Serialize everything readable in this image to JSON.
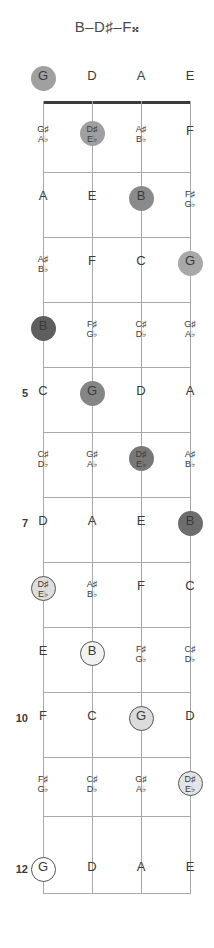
{
  "title": "B–D♯–F𝄪",
  "diagram": {
    "type": "guitar-fretboard",
    "orientation": "vertical",
    "instrument_strings": [
      "G",
      "D",
      "A",
      "E"
    ],
    "string_x": [
      43,
      92,
      141,
      190
    ],
    "nut_y": 101,
    "fret_spacing": 64.8,
    "fret_count": 12,
    "shown_fret_numbers": [
      "5",
      "7",
      "10",
      "12"
    ],
    "chord_tones": [
      "B",
      "D♯",
      "F𝄪"
    ],
    "colors": {
      "line": "#a8a8a8",
      "nut": "#3b3b3b",
      "text": "#3a3a3a",
      "marker_darkest": "#606060",
      "marker_dark": "#767676",
      "marker_mid": "#9a9a9a",
      "marker_light": "#c9c9c9",
      "marker_lighter": "#e0e0e0",
      "marker_open": "#ffffff"
    }
  },
  "open_strings": [
    {
      "label": "G",
      "x": 43,
      "marked": true,
      "fill": "#a0a0a0",
      "ring": false
    },
    {
      "label": "D",
      "x": 92,
      "marked": false
    },
    {
      "label": "A",
      "x": 141,
      "marked": false
    },
    {
      "label": "E",
      "x": 190,
      "marked": false
    }
  ],
  "frets": [
    {
      "number": 1,
      "label": "",
      "y": 133,
      "notes": [
        {
          "x": 43,
          "line1": "G♯",
          "line2": "A♭",
          "accidental": true,
          "marked": false
        },
        {
          "x": 92,
          "line1": "D♯",
          "line2": "E♭",
          "accidental": true,
          "marked": true,
          "fill": "#a0a0a0",
          "ring": false
        },
        {
          "x": 141,
          "line1": "A♯",
          "line2": "B♭",
          "accidental": true,
          "marked": false
        },
        {
          "x": 190,
          "line1": "F",
          "line2": "",
          "accidental": false,
          "marked": false
        }
      ]
    },
    {
      "number": 2,
      "label": "",
      "y": 198,
      "notes": [
        {
          "x": 43,
          "line1": "A",
          "line2": "",
          "accidental": false,
          "marked": false
        },
        {
          "x": 92,
          "line1": "E",
          "line2": "",
          "accidental": false,
          "marked": false
        },
        {
          "x": 141,
          "line1": "B",
          "line2": "",
          "accidental": false,
          "marked": true,
          "fill": "#8a8a8a",
          "ring": false
        },
        {
          "x": 190,
          "line1": "F♯",
          "line2": "G♭",
          "accidental": true,
          "marked": false
        }
      ]
    },
    {
      "number": 3,
      "label": "",
      "y": 263,
      "notes": [
        {
          "x": 43,
          "line1": "A♯",
          "line2": "B♭",
          "accidental": true,
          "marked": false
        },
        {
          "x": 92,
          "line1": "F",
          "line2": "",
          "accidental": false,
          "marked": false
        },
        {
          "x": 141,
          "line1": "C",
          "line2": "",
          "accidental": false,
          "marked": false
        },
        {
          "x": 190,
          "line1": "G",
          "line2": "",
          "accidental": false,
          "marked": true,
          "fill": "#a8a8a8",
          "ring": false
        }
      ]
    },
    {
      "number": 4,
      "label": "",
      "y": 328,
      "notes": [
        {
          "x": 43,
          "line1": "B",
          "line2": "",
          "accidental": false,
          "marked": true,
          "fill": "#5e5e5e",
          "ring": false
        },
        {
          "x": 92,
          "line1": "F♯",
          "line2": "G♭",
          "accidental": true,
          "marked": false
        },
        {
          "x": 141,
          "line1": "C♯",
          "line2": "D♭",
          "accidental": true,
          "marked": false
        },
        {
          "x": 190,
          "line1": "G♯",
          "line2": "A♭",
          "accidental": true,
          "marked": false
        }
      ]
    },
    {
      "number": 5,
      "label": "5",
      "y": 393,
      "notes": [
        {
          "x": 43,
          "line1": "C",
          "line2": "",
          "accidental": false,
          "marked": false
        },
        {
          "x": 92,
          "line1": "G",
          "line2": "",
          "accidental": false,
          "marked": true,
          "fill": "#858585",
          "ring": false
        },
        {
          "x": 141,
          "line1": "D",
          "line2": "",
          "accidental": false,
          "marked": false
        },
        {
          "x": 190,
          "line1": "A",
          "line2": "",
          "accidental": false,
          "marked": false
        }
      ]
    },
    {
      "number": 6,
      "label": "",
      "y": 458,
      "notes": [
        {
          "x": 43,
          "line1": "C♯",
          "line2": "D♭",
          "accidental": true,
          "marked": false
        },
        {
          "x": 92,
          "line1": "G♯",
          "line2": "A♭",
          "accidental": true,
          "marked": false
        },
        {
          "x": 141,
          "line1": "D♯",
          "line2": "E♭",
          "accidental": true,
          "marked": true,
          "fill": "#787878",
          "ring": false
        },
        {
          "x": 190,
          "line1": "A♯",
          "line2": "B♭",
          "accidental": true,
          "marked": false
        }
      ]
    },
    {
      "number": 7,
      "label": "7",
      "y": 523,
      "notes": [
        {
          "x": 43,
          "line1": "D",
          "line2": "",
          "accidental": false,
          "marked": false
        },
        {
          "x": 92,
          "line1": "A",
          "line2": "",
          "accidental": false,
          "marked": false
        },
        {
          "x": 141,
          "line1": "E",
          "line2": "",
          "accidental": false,
          "marked": false
        },
        {
          "x": 190,
          "line1": "B",
          "line2": "",
          "accidental": false,
          "marked": true,
          "fill": "#6d6d6d",
          "ring": false
        }
      ]
    },
    {
      "number": 8,
      "label": "",
      "y": 588,
      "notes": [
        {
          "x": 43,
          "line1": "D♯",
          "line2": "E♭",
          "accidental": true,
          "marked": true,
          "fill": "#dedede",
          "ring": true
        },
        {
          "x": 92,
          "line1": "A♯",
          "line2": "B♭",
          "accidental": true,
          "marked": false
        },
        {
          "x": 141,
          "line1": "F",
          "line2": "",
          "accidental": false,
          "marked": false
        },
        {
          "x": 190,
          "line1": "C",
          "line2": "",
          "accidental": false,
          "marked": false
        }
      ]
    },
    {
      "number": 9,
      "label": "",
      "y": 653,
      "notes": [
        {
          "x": 43,
          "line1": "E",
          "line2": "",
          "accidental": false,
          "marked": false
        },
        {
          "x": 92,
          "line1": "B",
          "line2": "",
          "accidental": false,
          "marked": true,
          "fill": "#f2f2f2",
          "ring": true
        },
        {
          "x": 141,
          "line1": "F♯",
          "line2": "G♭",
          "accidental": true,
          "marked": false
        },
        {
          "x": 190,
          "line1": "C♯",
          "line2": "D♭",
          "accidental": true,
          "marked": false
        }
      ]
    },
    {
      "number": 10,
      "label": "10",
      "y": 718,
      "notes": [
        {
          "x": 43,
          "line1": "F",
          "line2": "",
          "accidental": false,
          "marked": false
        },
        {
          "x": 92,
          "line1": "C",
          "line2": "",
          "accidental": false,
          "marked": false
        },
        {
          "x": 141,
          "line1": "G",
          "line2": "",
          "accidental": false,
          "marked": true,
          "fill": "#dcdcdc",
          "ring": true
        },
        {
          "x": 190,
          "line1": "D",
          "line2": "",
          "accidental": false,
          "marked": false
        }
      ]
    },
    {
      "number": 11,
      "label": "",
      "y": 783,
      "notes": [
        {
          "x": 43,
          "line1": "F♯",
          "line2": "G♭",
          "accidental": true,
          "marked": false
        },
        {
          "x": 92,
          "line1": "C♯",
          "line2": "D♭",
          "accidental": true,
          "marked": false
        },
        {
          "x": 141,
          "line1": "G♯",
          "line2": "A♭",
          "accidental": true,
          "marked": false
        },
        {
          "x": 190,
          "line1": "D♯",
          "line2": "E♭",
          "accidental": true,
          "marked": true,
          "fill": "#e4e4e4",
          "ring": true
        }
      ]
    },
    {
      "number": 12,
      "label": "12",
      "y": 869,
      "notes": [
        {
          "x": 43,
          "line1": "G",
          "line2": "",
          "accidental": false,
          "marked": true,
          "fill": "#ffffff",
          "ring": true
        },
        {
          "x": 92,
          "line1": "D",
          "line2": "",
          "accidental": false,
          "marked": false
        },
        {
          "x": 141,
          "line1": "A",
          "line2": "",
          "accidental": false,
          "marked": false
        },
        {
          "x": 190,
          "line1": "E",
          "line2": "",
          "accidental": false,
          "marked": false
        }
      ]
    }
  ]
}
